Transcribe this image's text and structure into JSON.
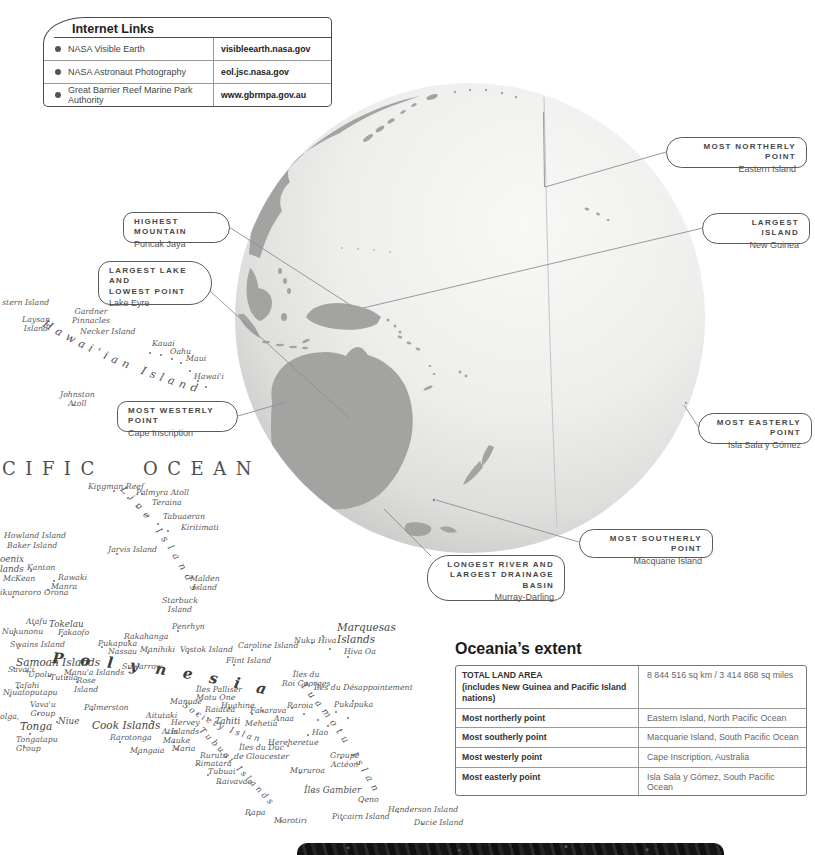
{
  "links_panel": {
    "title": "Internet Links",
    "rows": [
      {
        "name": "NASA Visible Earth",
        "url": "visibleearth.nasa.gov"
      },
      {
        "name": "NASA Astronaut Photography",
        "url": "eol.jsc.nasa.gov"
      },
      {
        "name": "Great Barrier Reef Marine Park Authority",
        "url": "www.gbrmpa.gov.au"
      }
    ]
  },
  "callouts": [
    {
      "id": "highest-mountain",
      "title": "HIGHEST MOUNTAIN",
      "sub": "Puncak Jaya",
      "x": 123,
      "y": 212,
      "w": 107,
      "h": 31,
      "side": "left",
      "big": false
    },
    {
      "id": "largest-lake-and-lowest-point",
      "title": "LARGEST LAKE AND\nLOWEST POINT",
      "sub": "Lake Eyre",
      "x": 98,
      "y": 261,
      "w": 114,
      "h": 44,
      "side": "left",
      "big": true
    },
    {
      "id": "most-westerly-point",
      "title": "MOST WESTERLY POINT",
      "sub": "Cape Inscription",
      "x": 117,
      "y": 401,
      "w": 121,
      "h": 31,
      "side": "left",
      "big": false
    },
    {
      "id": "most-northerly-point",
      "title": "MOST NORTHERLY POINT",
      "sub": "Eastern Island",
      "x": 666,
      "y": 137,
      "w": 141,
      "h": 31,
      "side": "right",
      "big": false
    },
    {
      "id": "largest-island",
      "title": "LARGEST ISLAND",
      "sub": "New Guinea",
      "x": 702,
      "y": 213,
      "w": 108,
      "h": 31,
      "side": "right",
      "big": false
    },
    {
      "id": "most-easterly-point",
      "title": "MOST EASTERLY POINT",
      "sub": "Isla Sala y Gómez",
      "x": 698,
      "y": 413,
      "w": 114,
      "h": 31,
      "side": "right",
      "big": false
    },
    {
      "id": "most-southerly-point",
      "title": "MOST SOUTHERLY POINT",
      "sub": "Macquarie Island",
      "x": 579,
      "y": 529,
      "w": 134,
      "h": 29,
      "side": "right",
      "big": false
    },
    {
      "id": "longest-river-largest-drainage-basin",
      "title": "LONGEST RIVER AND\nLARGEST DRAINAGE BASIN",
      "sub": "Murray-Darling",
      "x": 427,
      "y": 555,
      "w": 138,
      "h": 46,
      "side": "right",
      "big": true
    }
  ],
  "extent_table": {
    "title": "Oceania’s extent",
    "rows": [
      {
        "label": "TOTAL LAND AREA",
        "label2": "(includes New Guinea and Pacific Island nations)",
        "value": "8 844 516 sq km / 3 414 868 sq miles"
      },
      {
        "label": "Most northerly point",
        "label2": "",
        "value": "Eastern Island, North Pacific Ocean"
      },
      {
        "label": "Most southerly point",
        "label2": "",
        "value": "Macquarie Island, South Pacific Ocean"
      },
      {
        "label": "Most westerly point",
        "label2": "",
        "value": "Cape Inscription, Australia"
      },
      {
        "label": "Most easterly point",
        "label2": "",
        "value": "Isla Sala y Gómez, South Pacific Ocean"
      }
    ]
  },
  "map": {
    "ocean_label": "CIFIC OCEAN",
    "curved": {
      "hawaiian": "Hawai'ian Islands",
      "line": "Line Islands",
      "polynesia": "Polynesia",
      "tuamotu": "Tuamotu Islands",
      "society": "Society Islands",
      "tubuai": "Tubuai Islands"
    },
    "labels": [
      {
        "t": "stern Island",
        "x": 2,
        "y": 299
      },
      {
        "t": "Laysan\nIsland",
        "x": 22,
        "y": 316,
        "c": "ctr"
      },
      {
        "t": "Gardner\nPinnacles",
        "x": 72,
        "y": 308,
        "c": "ctr"
      },
      {
        "t": "Necker Island",
        "x": 80,
        "y": 328
      },
      {
        "t": "Kauai",
        "x": 152,
        "y": 340
      },
      {
        "t": "Oahu",
        "x": 170,
        "y": 348
      },
      {
        "t": "Maui",
        "x": 186,
        "y": 355
      },
      {
        "t": "Hawai'i",
        "x": 194,
        "y": 373
      },
      {
        "t": "Johnston\nAtoll",
        "x": 60,
        "y": 391,
        "c": "ctr"
      },
      {
        "t": "Kingman Reef",
        "x": 88,
        "y": 483
      },
      {
        "t": "Palmyra Atoll",
        "x": 136,
        "y": 489
      },
      {
        "t": "Teraina",
        "x": 152,
        "y": 499
      },
      {
        "t": "Tabuaeran",
        "x": 163,
        "y": 513
      },
      {
        "t": "Kiritimati",
        "x": 181,
        "y": 524
      },
      {
        "t": "Howland Island",
        "x": 4,
        "y": 532
      },
      {
        "t": "Baker Island",
        "x": 7,
        "y": 542
      },
      {
        "t": "Jarvis Island",
        "x": 108,
        "y": 546
      },
      {
        "t": "oenix\nlands",
        "x": 0,
        "y": 554,
        "c": "md"
      },
      {
        "t": "Kanton",
        "x": 27,
        "y": 564
      },
      {
        "t": "McKean",
        "x": 3,
        "y": 575
      },
      {
        "t": "Rawaki",
        "x": 58,
        "y": 574
      },
      {
        "t": "Manra",
        "x": 51,
        "y": 583
      },
      {
        "t": "ikumaroro",
        "x": 0,
        "y": 589
      },
      {
        "t": "Orona",
        "x": 44,
        "y": 589
      },
      {
        "t": "Malden\nIsland",
        "x": 190,
        "y": 575,
        "c": "ctr"
      },
      {
        "t": "Starbuck\nIsland",
        "x": 162,
        "y": 597,
        "c": "ctr"
      },
      {
        "t": "Penrhyn",
        "x": 172,
        "y": 623
      },
      {
        "t": "Atafu",
        "x": 26,
        "y": 618
      },
      {
        "t": "Tokelau",
        "x": 49,
        "y": 619,
        "c": "md"
      },
      {
        "t": "Nukunonu",
        "x": 2,
        "y": 628
      },
      {
        "t": "Fakaofo",
        "x": 58,
        "y": 629
      },
      {
        "t": "Swains Island",
        "x": 10,
        "y": 641
      },
      {
        "t": "Pukapuka",
        "x": 98,
        "y": 640
      },
      {
        "t": "Nassau",
        "x": 108,
        "y": 648
      },
      {
        "t": "Rakahanga",
        "x": 124,
        "y": 633
      },
      {
        "t": "Manihiki",
        "x": 140,
        "y": 646
      },
      {
        "t": "Vostok Island",
        "x": 180,
        "y": 646
      },
      {
        "t": "Suwarrow",
        "x": 122,
        "y": 663
      },
      {
        "t": "Samoan Islands",
        "x": 16,
        "y": 656,
        "c": "lg"
      },
      {
        "t": "Savai'i",
        "x": 8,
        "y": 666
      },
      {
        "t": "'Upolu",
        "x": 26,
        "y": 671
      },
      {
        "t": "Tutuila",
        "x": 50,
        "y": 674
      },
      {
        "t": "Manu'a Islands",
        "x": 64,
        "y": 669
      },
      {
        "t": "Rose\nIsland",
        "x": 74,
        "y": 677,
        "c": "ctr"
      },
      {
        "t": "Tafahi",
        "x": 15,
        "y": 682
      },
      {
        "t": "Niuatoputapu",
        "x": 3,
        "y": 689
      },
      {
        "t": "Vava'u\nGroup",
        "x": 30,
        "y": 701,
        "c": "ctr"
      },
      {
        "t": "olga,",
        "x": 0,
        "y": 713
      },
      {
        "t": "Niue",
        "x": 58,
        "y": 716,
        "c": "md"
      },
      {
        "t": "Tonga",
        "x": 20,
        "y": 720,
        "c": "lg"
      },
      {
        "t": "Tongatapu\nGroup",
        "x": 16,
        "y": 736
      },
      {
        "t": "Palmerston",
        "x": 84,
        "y": 704
      },
      {
        "t": "Cook Islands",
        "x": 92,
        "y": 719,
        "c": "lg"
      },
      {
        "t": "Aitutaki",
        "x": 146,
        "y": 712
      },
      {
        "t": "Manuae",
        "x": 170,
        "y": 698
      },
      {
        "t": "Motu One",
        "x": 196,
        "y": 694
      },
      {
        "t": "Raiatea",
        "x": 205,
        "y": 706
      },
      {
        "t": "Huahine",
        "x": 221,
        "y": 702
      },
      {
        "t": "Fakarava",
        "x": 250,
        "y": 707
      },
      {
        "t": "Tahiti",
        "x": 215,
        "y": 716,
        "c": "md"
      },
      {
        "t": "Mehetia",
        "x": 245,
        "y": 720
      },
      {
        "t": "Anaa",
        "x": 274,
        "y": 715
      },
      {
        "t": "Hervey\nIslands",
        "x": 171,
        "y": 719
      },
      {
        "t": "Atiu",
        "x": 162,
        "y": 728
      },
      {
        "t": "Rarotonga",
        "x": 110,
        "y": 734
      },
      {
        "t": "Mauke",
        "x": 163,
        "y": 737
      },
      {
        "t": "Maria",
        "x": 172,
        "y": 745
      },
      {
        "t": "Mangaia",
        "x": 130,
        "y": 747
      },
      {
        "t": "Rimatara",
        "x": 195,
        "y": 760
      },
      {
        "t": "Rurutu",
        "x": 200,
        "y": 752
      },
      {
        "t": "Tubuai",
        "x": 208,
        "y": 768
      },
      {
        "t": "Raivavae",
        "x": 216,
        "y": 778
      },
      {
        "t": "Rapa",
        "x": 245,
        "y": 809
      },
      {
        "t": "Marotiri",
        "x": 274,
        "y": 817
      },
      {
        "t": "Îles Palliser",
        "x": 196,
        "y": 686
      },
      {
        "t": "Îles du\nRoi Georges",
        "x": 282,
        "y": 671,
        "c": "ctr"
      },
      {
        "t": "Îles du Désappointement",
        "x": 314,
        "y": 684
      },
      {
        "t": "Raroia",
        "x": 287,
        "y": 702
      },
      {
        "t": "Pukapuka",
        "x": 334,
        "y": 701
      },
      {
        "t": "Hao",
        "x": 312,
        "y": 729
      },
      {
        "t": "Hereheretue",
        "x": 268,
        "y": 739
      },
      {
        "t": "Îles du Duc\nde Gloucester",
        "x": 234,
        "y": 744,
        "c": "ctr"
      },
      {
        "t": "Groupe\nActéon",
        "x": 330,
        "y": 752,
        "c": "ctr"
      },
      {
        "t": "Mururoa",
        "x": 290,
        "y": 767
      },
      {
        "t": "Îles Gambier",
        "x": 304,
        "y": 785,
        "c": "md"
      },
      {
        "t": "Oeno",
        "x": 358,
        "y": 796
      },
      {
        "t": "Henderson Island",
        "x": 388,
        "y": 806
      },
      {
        "t": "Pitcairn Island",
        "x": 332,
        "y": 813
      },
      {
        "t": "Ducie Island",
        "x": 414,
        "y": 819
      },
      {
        "t": "Marquesas\nIslands",
        "x": 337,
        "y": 621,
        "c": "lg"
      },
      {
        "t": "Nuku Hiva",
        "x": 294,
        "y": 637
      },
      {
        "t": "Hiva Oa",
        "x": 344,
        "y": 648
      },
      {
        "t": "Caroline Island",
        "x": 238,
        "y": 642
      },
      {
        "t": "Flint Island",
        "x": 226,
        "y": 657
      }
    ],
    "dots": [
      [
        149,
        352
      ],
      [
        160,
        354
      ],
      [
        171,
        358
      ],
      [
        180,
        362
      ],
      [
        189,
        370
      ],
      [
        197,
        380
      ],
      [
        205,
        386
      ],
      [
        73,
        404
      ],
      [
        127,
        497
      ],
      [
        136,
        506
      ],
      [
        146,
        515
      ],
      [
        157,
        523
      ],
      [
        167,
        530
      ],
      [
        113,
        490
      ],
      [
        141,
        493
      ],
      [
        116,
        553
      ],
      [
        30,
        570
      ],
      [
        53,
        580
      ],
      [
        47,
        589
      ],
      [
        12,
        596
      ],
      [
        33,
        624
      ],
      [
        13,
        634
      ],
      [
        61,
        635
      ],
      [
        17,
        647
      ],
      [
        101,
        646
      ],
      [
        128,
        640
      ],
      [
        147,
        652
      ],
      [
        177,
        630
      ],
      [
        187,
        652
      ],
      [
        128,
        667
      ],
      [
        13,
        667
      ],
      [
        26,
        670
      ],
      [
        48,
        675
      ],
      [
        66,
        676
      ],
      [
        76,
        681
      ],
      [
        17,
        687
      ],
      [
        9,
        695
      ],
      [
        37,
        713
      ],
      [
        29,
        733
      ],
      [
        23,
        745
      ],
      [
        56,
        721
      ],
      [
        91,
        709
      ],
      [
        151,
        720
      ],
      [
        167,
        732
      ],
      [
        173,
        741
      ],
      [
        119,
        741
      ],
      [
        137,
        753
      ],
      [
        176,
        748
      ],
      [
        197,
        713
      ],
      [
        207,
        717
      ],
      [
        219,
        722
      ],
      [
        228,
        707
      ],
      [
        251,
        713
      ],
      [
        262,
        710
      ],
      [
        291,
        707
      ],
      [
        303,
        713
      ],
      [
        317,
        719
      ],
      [
        327,
        725
      ],
      [
        307,
        734
      ],
      [
        287,
        745
      ],
      [
        335,
        711
      ],
      [
        347,
        717
      ],
      [
        352,
        700
      ],
      [
        299,
        772
      ],
      [
        313,
        791
      ],
      [
        340,
        757
      ],
      [
        197,
        763
      ],
      [
        207,
        774
      ],
      [
        219,
        782
      ],
      [
        249,
        814
      ],
      [
        280,
        820
      ],
      [
        311,
        642
      ],
      [
        329,
        648
      ],
      [
        347,
        656
      ],
      [
        322,
        635
      ],
      [
        251,
        649
      ],
      [
        233,
        664
      ],
      [
        361,
        801
      ],
      [
        341,
        819
      ],
      [
        397,
        811
      ],
      [
        421,
        823
      ],
      [
        97,
        489
      ]
    ]
  }
}
